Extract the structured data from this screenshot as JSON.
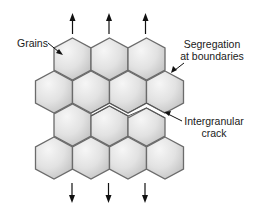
{
  "figure": {
    "type": "diagram",
    "labels": {
      "grains": "Grains",
      "segregation_line1": "Segregation",
      "segregation_line2": "at boundaries",
      "crack_line1": "Intergranular",
      "crack_line2": "crack"
    },
    "grain_rows": [
      {
        "row": 1,
        "count": 3
      },
      {
        "row": 2,
        "count": 4
      },
      {
        "row": 3,
        "count": 3
      },
      {
        "row": 4,
        "count": 4
      }
    ],
    "load_arrows": {
      "top": {
        "direction": "up",
        "count": 3
      },
      "bottom": {
        "direction": "down",
        "count": 3
      }
    },
    "colors": {
      "grain_fill_light": "#f4f4f4",
      "grain_fill_dark": "#c4c4c4",
      "grain_stroke": "#6b6b6b",
      "arrow": "#111111",
      "text": "#1a1a1a"
    }
  }
}
